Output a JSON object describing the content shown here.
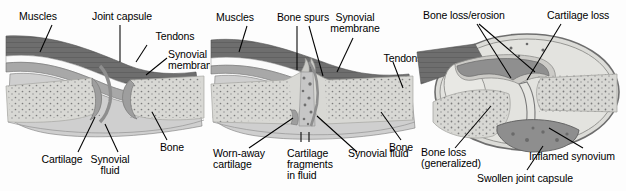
{
  "figure": {
    "background_color": "#fdfdfd",
    "panel_count": 3
  },
  "palette": {
    "muscle": "#6e6e6e",
    "muscle_dark": "#5a5a5a",
    "tendon": "#fbfbfb",
    "capsule": "#a8a8a8",
    "synovial_membrane": "#8e8e8e",
    "cartilage": "#b4b4b4",
    "bone_fill": "#d8d8d4",
    "bone_cortex": "#c2c2be",
    "trabecula_dot": "#7d7d7d",
    "joint_fluid": "#cfcfcf",
    "outline": "#555555",
    "leader_line": "#000000",
    "text": "#000000"
  },
  "panels": [
    {
      "id": "normal-joint",
      "name": "Normal joint",
      "labels": [
        {
          "id": "muscles",
          "text": "Muscles",
          "lines": [
            "Muscles"
          ]
        },
        {
          "id": "joint-capsule",
          "text": "Joint capsule",
          "lines": [
            "Joint capsule"
          ]
        },
        {
          "id": "tendons",
          "text": "Tendons",
          "lines": [
            "Tendons"
          ]
        },
        {
          "id": "synovial-membrane",
          "text": "Synovial membrane",
          "lines": [
            "Synovial",
            "membrane"
          ]
        },
        {
          "id": "cartilage",
          "text": "Cartilage",
          "lines": [
            "Cartilage"
          ]
        },
        {
          "id": "synovial-fluid",
          "text": "Synovial fluid",
          "lines": [
            "Synovial",
            "fluid"
          ]
        },
        {
          "id": "bone",
          "text": "Bone",
          "lines": [
            "Bone"
          ]
        }
      ]
    },
    {
      "id": "osteoarthritis-joint",
      "name": "Osteoarthritis joint",
      "labels": [
        {
          "id": "muscles",
          "text": "Muscles",
          "lines": [
            "Muscles"
          ]
        },
        {
          "id": "bone-spurs",
          "text": "Bone spurs",
          "lines": [
            "Bone spurs"
          ]
        },
        {
          "id": "synovial-membrane",
          "text": "Synovial membrane",
          "lines": [
            "Synovial",
            "membrane"
          ]
        },
        {
          "id": "tendons",
          "text": "Tendons",
          "lines": [
            "Tendons"
          ]
        },
        {
          "id": "worn-away-cartilage",
          "text": "Worn-away cartilage",
          "lines": [
            "Worn-away",
            "cartilage"
          ]
        },
        {
          "id": "cartilage-fragments",
          "text": "Cartilage fragments in fluid",
          "lines": [
            "Cartilage",
            "fragments",
            "in fluid"
          ]
        },
        {
          "id": "synovial-fluid",
          "text": "Synovial fluid",
          "lines": [
            "Synovial fluid"
          ]
        },
        {
          "id": "bone",
          "text": "Bone",
          "lines": [
            "Bone"
          ]
        }
      ]
    },
    {
      "id": "rheumatoid-arthritis-joint",
      "name": "Rheumatoid arthritis joint",
      "labels": [
        {
          "id": "bone-loss-erosion",
          "text": "Bone loss/erosion",
          "lines": [
            "Bone loss/erosion"
          ]
        },
        {
          "id": "cartilage-loss",
          "text": "Cartilage loss",
          "lines": [
            "Cartilage loss"
          ]
        },
        {
          "id": "bone-loss-generalized",
          "text": "Bone loss (generalized)",
          "lines": [
            "Bone loss",
            "(generalized)"
          ]
        },
        {
          "id": "inflamed-synovium",
          "text": "Inflamed synovium",
          "lines": [
            "Inflamed synovium"
          ]
        },
        {
          "id": "swollen-joint-capsule",
          "text": "Swollen joint capsule",
          "lines": [
            "Swollen joint capsule"
          ]
        }
      ]
    }
  ]
}
